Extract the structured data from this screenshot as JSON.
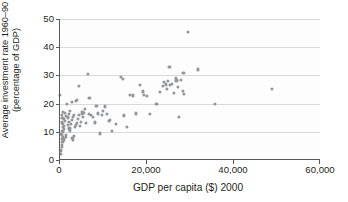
{
  "chart_data": {
    "type": "scatter",
    "title": "",
    "xlabel": "GDP per capita ($) 2000",
    "ylabel_line1": "Average investment rate 1960–90",
    "ylabel_line2": "(percentage of GDP)",
    "xlim": [
      0,
      60000
    ],
    "ylim": [
      0,
      50
    ],
    "xticks": [
      0,
      20000,
      40000,
      60000
    ],
    "xtick_labels": [
      "0",
      "20,000",
      "40,000",
      "60,000"
    ],
    "yticks": [
      0,
      10,
      20,
      30,
      40,
      50
    ],
    "ytick_labels": [
      "0",
      "10",
      "20",
      "30",
      "40",
      "50"
    ],
    "grid": "horizontal",
    "legend": "none",
    "marker_color": "#939598",
    "axis_color": "#58595b",
    "grid_color": "#d9d9d9",
    "series": [
      {
        "name": "Countries",
        "points": [
          [
            400,
            2.2
          ],
          [
            500,
            3.4
          ],
          [
            600,
            4.6
          ],
          [
            700,
            5.3
          ],
          [
            800,
            6.4
          ],
          [
            600,
            7.6
          ],
          [
            900,
            8.0
          ],
          [
            700,
            8.9
          ],
          [
            500,
            9.3
          ],
          [
            1000,
            9.8
          ],
          [
            800,
            10.4
          ],
          [
            1100,
            11.0
          ],
          [
            900,
            11.6
          ],
          [
            1200,
            12.1
          ],
          [
            1000,
            12.7
          ],
          [
            700,
            13.3
          ],
          [
            1300,
            13.8
          ],
          [
            1100,
            14.4
          ],
          [
            800,
            15.0
          ],
          [
            1500,
            15.6
          ],
          [
            600,
            16.0
          ],
          [
            1400,
            16.6
          ],
          [
            900,
            17.1
          ],
          [
            1700,
            9.0
          ],
          [
            1200,
            7.3
          ],
          [
            1600,
            8.2
          ],
          [
            300,
            23.2
          ],
          [
            1900,
            20.0
          ],
          [
            2100,
            12.4
          ],
          [
            2300,
            13.6
          ],
          [
            2000,
            15.1
          ],
          [
            2200,
            16.2
          ],
          [
            2500,
            17.3
          ],
          [
            2400,
            11.2
          ],
          [
            2600,
            10.2
          ],
          [
            2800,
            12.9
          ],
          [
            3000,
            14.2
          ],
          [
            3200,
            15.3
          ],
          [
            3400,
            16.1
          ],
          [
            2900,
            20.5
          ],
          [
            3100,
            7.8
          ],
          [
            3300,
            7.2
          ],
          [
            3500,
            8.6
          ],
          [
            3700,
            11.7
          ],
          [
            3900,
            12.3
          ],
          [
            4100,
            13.1
          ],
          [
            4300,
            14.6
          ],
          [
            4500,
            15.9
          ],
          [
            4200,
            21.3
          ],
          [
            4000,
            20.8
          ],
          [
            4600,
            26.4
          ],
          [
            4800,
            12.2
          ],
          [
            5000,
            13.4
          ],
          [
            5200,
            16.4
          ],
          [
            5400,
            17.0
          ],
          [
            5600,
            15.4
          ],
          [
            5800,
            16.8
          ],
          [
            6000,
            18.0
          ],
          [
            6200,
            13.0
          ],
          [
            6600,
            30.5
          ],
          [
            6800,
            16.3
          ],
          [
            7000,
            21.9
          ],
          [
            7400,
            16.1
          ],
          [
            7800,
            15.2
          ],
          [
            8200,
            13.3
          ],
          [
            8600,
            19.2
          ],
          [
            9000,
            16.5
          ],
          [
            9400,
            9.4
          ],
          [
            9800,
            16.0
          ],
          [
            10200,
            17.3
          ],
          [
            10600,
            19.0
          ],
          [
            11000,
            16.2
          ],
          [
            11400,
            14.0
          ],
          [
            11800,
            14.1
          ],
          [
            12200,
            10.4
          ],
          [
            13000,
            12.9
          ],
          [
            14200,
            29.4
          ],
          [
            14600,
            28.7
          ],
          [
            15000,
            15.8
          ],
          [
            15600,
            11.8
          ],
          [
            16400,
            23.2
          ],
          [
            17000,
            22.9
          ],
          [
            17600,
            16.5
          ],
          [
            18600,
            26.5
          ],
          [
            19200,
            24.3
          ],
          [
            19600,
            23.0
          ],
          [
            20200,
            22.6
          ],
          [
            21000,
            16.3
          ],
          [
            22400,
            19.9
          ],
          [
            23200,
            24.0
          ],
          [
            23800,
            26.1
          ],
          [
            24200,
            27.6
          ],
          [
            24600,
            26.8
          ],
          [
            24800,
            25.2
          ],
          [
            25000,
            28.0
          ],
          [
            25400,
            33.0
          ],
          [
            25600,
            26.5
          ],
          [
            26000,
            27.0
          ],
          [
            26400,
            23.8
          ],
          [
            26800,
            29.0
          ],
          [
            27000,
            28.2
          ],
          [
            27400,
            25.9
          ],
          [
            27600,
            15.4
          ],
          [
            28000,
            28.5
          ],
          [
            28400,
            24.6
          ],
          [
            28800,
            23.5
          ],
          [
            28600,
            30.8
          ],
          [
            29600,
            45.5
          ],
          [
            32000,
            32.1
          ],
          [
            35800,
            19.9
          ],
          [
            49000,
            25.1
          ]
        ]
      }
    ]
  }
}
